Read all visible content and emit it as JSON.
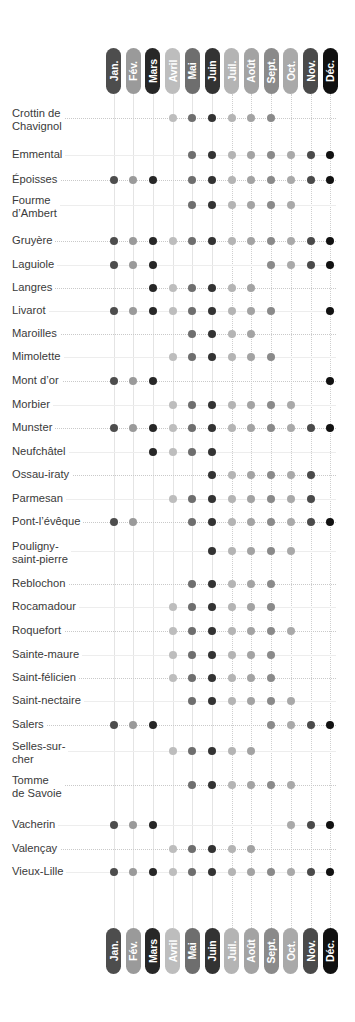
{
  "chart_data": {
    "type": "heatmap",
    "title": "",
    "xlabel": "",
    "ylabel": "",
    "grid": true,
    "legend_position": "none",
    "categories": [
      "Jan.",
      "Fév.",
      "Mars",
      "Avril",
      "Mai",
      "Juin",
      "Juil.",
      "Août",
      "Sept.",
      "Oct.",
      "Nov.",
      "Déc."
    ],
    "month_colors": [
      "#4d4d4d",
      "#9a9a9a",
      "#272727",
      "#bdbdbd",
      "#6e6e6e",
      "#333333",
      "#b4b4b4",
      "#a3a3a3",
      "#8a8a8a",
      "#a9a9a9",
      "#4a4a4a",
      "#111111"
    ],
    "rows": [
      {
        "label": "Crottin de\nChavignol",
        "values": [
          0,
          0,
          0,
          1,
          1,
          1,
          1,
          1,
          1,
          0,
          0,
          0
        ]
      },
      {
        "label": "Emmental",
        "values": [
          0,
          0,
          0,
          0,
          1,
          1,
          1,
          1,
          1,
          1,
          1,
          1
        ]
      },
      {
        "label": "Époisses",
        "values": [
          1,
          1,
          1,
          0,
          1,
          1,
          1,
          1,
          1,
          1,
          1,
          1
        ]
      },
      {
        "label": "Fourme\nd’Ambert",
        "values": [
          0,
          0,
          0,
          0,
          1,
          1,
          1,
          1,
          1,
          1,
          0,
          0
        ]
      },
      {
        "label": "Gruyère",
        "values": [
          1,
          1,
          1,
          1,
          1,
          1,
          1,
          1,
          1,
          1,
          1,
          1
        ]
      },
      {
        "label": "Laguiole",
        "values": [
          1,
          1,
          1,
          0,
          0,
          0,
          0,
          0,
          1,
          1,
          1,
          1
        ]
      },
      {
        "label": "Langres",
        "values": [
          0,
          0,
          1,
          1,
          1,
          1,
          1,
          1,
          0,
          0,
          0,
          0
        ]
      },
      {
        "label": "Livarot",
        "values": [
          1,
          1,
          1,
          1,
          1,
          1,
          1,
          1,
          1,
          0,
          0,
          1
        ]
      },
      {
        "label": "Maroilles",
        "values": [
          0,
          0,
          0,
          0,
          1,
          1,
          1,
          1,
          0,
          0,
          0,
          0
        ]
      },
      {
        "label": "Mimolette",
        "values": [
          0,
          0,
          0,
          1,
          1,
          1,
          1,
          1,
          1,
          0,
          0,
          0
        ]
      },
      {
        "label": "Mont d’or",
        "values": [
          1,
          1,
          1,
          0,
          0,
          0,
          0,
          0,
          0,
          0,
          0,
          1
        ]
      },
      {
        "label": "Morbier",
        "values": [
          0,
          0,
          0,
          1,
          1,
          1,
          1,
          1,
          1,
          1,
          0,
          0
        ]
      },
      {
        "label": "Munster",
        "values": [
          1,
          1,
          1,
          1,
          1,
          1,
          1,
          1,
          1,
          1,
          1,
          1
        ]
      },
      {
        "label": "Neufchâtel",
        "values": [
          0,
          0,
          1,
          1,
          1,
          1,
          0,
          0,
          0,
          0,
          0,
          0
        ]
      },
      {
        "label": "Ossau-iraty",
        "values": [
          0,
          0,
          0,
          0,
          0,
          1,
          1,
          1,
          1,
          1,
          1,
          0
        ]
      },
      {
        "label": "Parmesan",
        "values": [
          0,
          0,
          0,
          1,
          1,
          1,
          1,
          1,
          1,
          1,
          1,
          0
        ]
      },
      {
        "label": "Pont-l’évêque",
        "values": [
          1,
          1,
          0,
          0,
          1,
          1,
          1,
          1,
          1,
          1,
          1,
          1
        ]
      },
      {
        "label": "Pouligny-\nsaint-pierre",
        "values": [
          0,
          0,
          0,
          0,
          0,
          1,
          1,
          1,
          1,
          1,
          0,
          0
        ]
      },
      {
        "label": "Reblochon",
        "values": [
          0,
          0,
          0,
          0,
          1,
          1,
          1,
          1,
          1,
          0,
          0,
          0
        ]
      },
      {
        "label": "Rocamadour",
        "values": [
          0,
          0,
          0,
          1,
          1,
          1,
          1,
          1,
          1,
          0,
          0,
          0
        ]
      },
      {
        "label": "Roquefort",
        "values": [
          0,
          0,
          0,
          1,
          1,
          1,
          1,
          1,
          1,
          1,
          0,
          0
        ]
      },
      {
        "label": "Sainte-maure",
        "values": [
          0,
          0,
          0,
          1,
          1,
          1,
          1,
          1,
          1,
          0,
          0,
          0
        ]
      },
      {
        "label": "Saint-félicien",
        "values": [
          0,
          0,
          0,
          1,
          1,
          1,
          1,
          1,
          1,
          0,
          0,
          0
        ]
      },
      {
        "label": "Saint-nectaire",
        "values": [
          0,
          0,
          0,
          0,
          1,
          1,
          1,
          1,
          1,
          1,
          0,
          0
        ]
      },
      {
        "label": "Salers",
        "values": [
          1,
          1,
          1,
          0,
          0,
          0,
          0,
          0,
          1,
          1,
          1,
          1
        ]
      },
      {
        "label": "Selles-sur-\ncher",
        "values": [
          0,
          0,
          0,
          1,
          1,
          1,
          1,
          1,
          0,
          0,
          0,
          0
        ]
      },
      {
        "label": "Tomme\nde Savoie",
        "values": [
          0,
          0,
          0,
          0,
          1,
          1,
          1,
          1,
          1,
          1,
          0,
          0
        ]
      },
      {
        "label": "Vacherin",
        "values": [
          1,
          1,
          1,
          0,
          0,
          0,
          0,
          0,
          0,
          1,
          1,
          1
        ]
      },
      {
        "label": "Valençay",
        "values": [
          0,
          0,
          0,
          1,
          1,
          1,
          1,
          1,
          0,
          0,
          0,
          0
        ]
      },
      {
        "label": "Vieux-Lille",
        "values": [
          1,
          1,
          1,
          1,
          1,
          1,
          1,
          1,
          1,
          1,
          1,
          1
        ]
      }
    ]
  }
}
